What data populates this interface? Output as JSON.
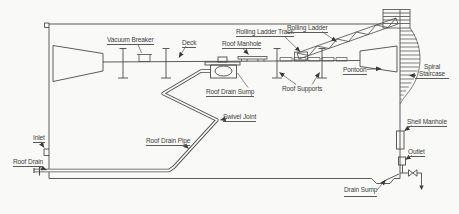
{
  "labels": {
    "vacuum_breaker": "Vacuum Breaker",
    "deck": "Deck",
    "roof_manhole": "Roof Manhole",
    "rolling_ladder_track": "Rolling Ladder Track",
    "rolling_ladder": "Rolling Ladder",
    "pontoon": "Pontoon",
    "spiral_staircase": "Spiral Staircase",
    "roof_drain_sump": "Roof Drain Sump",
    "roof_supports": "Roof Supports",
    "swivel_joint": "Swivel Joint",
    "roof_drain_pipe": "Roof Drain Pipe",
    "inlet": "Inlet",
    "roof_drain": "Roof Drain",
    "shell_manhole": "Shell Manhole",
    "outlet": "Outlet",
    "drain_sump": "Drain Sump"
  },
  "colors": {
    "line": "#4a4a4a",
    "text": "#3b3b3b",
    "background": "#f9f9f7"
  }
}
